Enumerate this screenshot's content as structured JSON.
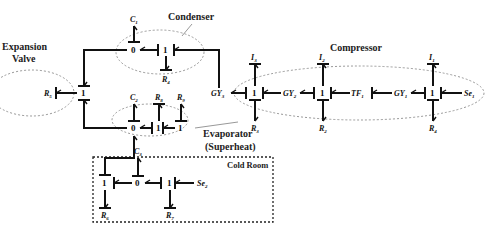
{
  "diagram": {
    "type": "bond-graph",
    "groups": {
      "condenser": "Condenser",
      "expansion_valve_line1": "Expansion",
      "expansion_valve_line2": "Valve",
      "compressor": "Compressor",
      "evaporator_line1": "Evaporator",
      "evaporator_line2": "(Superheat)",
      "cold_room": "Cold Room"
    },
    "junctions": {
      "zero": "0",
      "one": "1"
    },
    "elements": {
      "C1": {
        "base": "C",
        "sub": "1"
      },
      "C2": {
        "base": "C",
        "sub": "2"
      },
      "C3": {
        "base": "C",
        "sub": "3"
      },
      "R1": {
        "base": "R",
        "sub": "1"
      },
      "R2": {
        "base": "R",
        "sub": "2"
      },
      "R3": {
        "base": "R",
        "sub": "3"
      },
      "R4": {
        "base": "R",
        "sub": "4"
      },
      "R5": {
        "base": "R",
        "sub": "5"
      },
      "R6": {
        "base": "R",
        "sub": "6"
      },
      "R7": {
        "base": "R",
        "sub": "7"
      },
      "R8": {
        "base": "R",
        "sub": "8"
      },
      "R9": {
        "base": "R",
        "sub": "9"
      },
      "I1": {
        "base": "I",
        "sub": "1"
      },
      "I2": {
        "base": "I",
        "sub": "2"
      },
      "I3": {
        "base": "I",
        "sub": "3"
      },
      "GY1": {
        "base": "GY",
        "sub": "1"
      },
      "GY2": {
        "base": "GY",
        "sub": "2"
      },
      "GY3": {
        "base": "GY",
        "sub": "3"
      },
      "TF1": {
        "base": "TF",
        "sub": "1"
      },
      "Se1": {
        "base": "Se",
        "sub": "1"
      },
      "Se2": {
        "base": "Se",
        "sub": "2"
      }
    }
  }
}
